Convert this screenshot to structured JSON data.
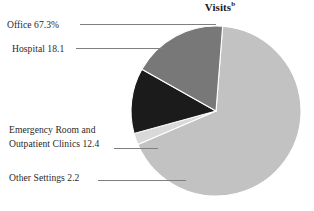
{
  "chart_data": {
    "type": "pie",
    "title": "Visits",
    "title_footnote": "b",
    "xlabel": "",
    "ylabel": "",
    "legend_position": "callout-labels-left",
    "grid": false,
    "units": "percent",
    "categories": [
      "Office",
      "Hospital",
      "Emergency Room and Outpatient Clinics",
      "Other Settings"
    ],
    "values": [
      67.3,
      18.1,
      12.4,
      2.2
    ],
    "value_labels": [
      "67.3%",
      "18.1",
      "12.4",
      "2.2"
    ],
    "colors": [
      "#c2c2c2",
      "#787878",
      "#1b1b1b",
      "#d9d9d9"
    ],
    "slices": [
      {
        "name": "Office",
        "label": "Office 67.3%",
        "value": 67.3,
        "value_label": "67.3%",
        "color": "#c2c2c2"
      },
      {
        "name": "Hospital",
        "label": "Hospital 18.1",
        "value": 18.1,
        "value_label": "18.1",
        "color": "#787878"
      },
      {
        "name": "Emergency Room and Outpatient Clinics",
        "label_line1": "Emergency Room and",
        "label_line2": "Outpatient Clinics 12.4",
        "value": 12.4,
        "value_label": "12.4",
        "color": "#1b1b1b"
      },
      {
        "name": "Other Settings",
        "label": "Other Settings 2.2",
        "value": 2.2,
        "value_label": "2.2",
        "color": "#d9d9d9"
      }
    ]
  },
  "figure": {
    "background_color": "#ffffff",
    "text_color": "#2a2a2a",
    "leader_line_color": "#7f7f7f",
    "slice_edge_color": "#ffffff"
  }
}
